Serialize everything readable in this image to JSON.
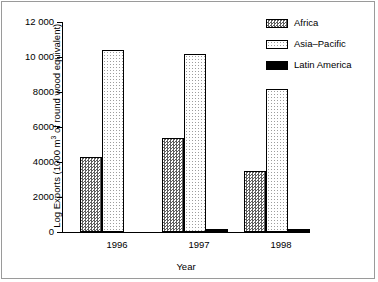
{
  "chart_data": {
    "type": "bar",
    "title": "",
    "categories": [
      "1996",
      "1997",
      "1998"
    ],
    "series": [
      {
        "name": "Africa",
        "values": [
          4300,
          5400,
          3500
        ],
        "fill": "dark-checker"
      },
      {
        "name": "Asia–Pacific",
        "values": [
          10400,
          10200,
          8200
        ],
        "fill": "light-dotted"
      },
      {
        "name": "Latin America",
        "values": [
          0,
          200,
          150
        ],
        "fill": "solid-black"
      }
    ],
    "xlabel": "Year",
    "ylabel": "Log Exports (1000 m3 of round wood equivalent)",
    "ylabel_prefix": "Log Exports (1000 m",
    "ylabel_exponent": "3",
    "ylabel_suffix": " of round wood equivalent)",
    "ylim": [
      0,
      12000
    ],
    "yticks": [
      0,
      2000,
      4000,
      6000,
      8000,
      10000,
      12000
    ],
    "ytick_labels": [
      "0",
      "2000",
      "4000",
      "6000",
      "8000",
      "10 000",
      "12 000"
    ],
    "grid": false,
    "legend_position": "top-right",
    "colors": {
      "axis": "#000000",
      "frame": "#9a9a9a",
      "africa": "#5f5f5f",
      "asia_pacific": "#9d9d9d",
      "latin_america": "#000000",
      "background": "#ffffff"
    }
  },
  "legend": {
    "entries": [
      {
        "label": "Africa"
      },
      {
        "label": "Asia–Pacific"
      },
      {
        "label": "Latin America"
      }
    ]
  },
  "axes": {
    "x_title": "Year",
    "y_tick_labels": [
      "12 000",
      "10 000",
      "8000",
      "6000",
      "4000",
      "2000",
      "0"
    ],
    "x_categories": [
      "1996",
      "1997",
      "1998"
    ]
  }
}
